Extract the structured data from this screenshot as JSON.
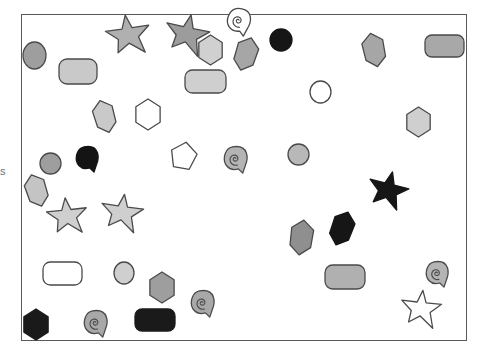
{
  "canvas": {
    "width": 481,
    "height": 355,
    "background": "#ffffff",
    "edge_mark_text": "s"
  },
  "frame": {
    "x": 21,
    "y": 14,
    "width": 446,
    "height": 327,
    "stroke": "#58585a",
    "stroke_width": 1.4,
    "fill": "#ffffff"
  },
  "palette": {
    "outline": "#4a4a4a",
    "black": "#1a1a1a",
    "dark_gray": "#8c8c8c",
    "mid_gray": "#9e9e9e",
    "light_gray": "#c9c9c9",
    "pale_gray": "#d6d6d6",
    "white": "#ffffff"
  },
  "shapes": [
    {
      "name": "circle-top-left-gray",
      "type": "circle",
      "x": 23,
      "y": 42,
      "w": 23,
      "h": 27,
      "fill": "#9e9e9e",
      "stroke": "#4a4a4a",
      "rotate": 0
    },
    {
      "name": "star-top-light-gray",
      "type": "star",
      "x": 105,
      "y": 13,
      "w": 46,
      "h": 44,
      "fill": "#b0b0b0",
      "stroke": "#4a4a4a",
      "rotate": -8
    },
    {
      "name": "star-top-mid-gray",
      "type": "star",
      "x": 164,
      "y": 12,
      "w": 46,
      "h": 44,
      "fill": "#9c9c9c",
      "stroke": "#4a4a4a",
      "rotate": 12
    },
    {
      "name": "hexagon-top-pale",
      "type": "hexagon",
      "x": 197,
      "y": 35,
      "w": 27,
      "h": 30,
      "fill": "#d0d0d0",
      "stroke": "#4a4a4a",
      "rotate": 0
    },
    {
      "name": "spiral-top-white",
      "type": "spiral",
      "x": 226,
      "y": 8,
      "w": 26,
      "h": 27,
      "fill": "#ffffff",
      "stroke": "#4a4a4a",
      "rotate": 10
    },
    {
      "name": "diamond-top-gray",
      "type": "diamond",
      "x": 234,
      "y": 37,
      "w": 24,
      "h": 34,
      "fill": "#a6a6a6",
      "stroke": "#4a4a4a",
      "rotate": 18
    },
    {
      "name": "circle-top-black",
      "type": "circle",
      "x": 270,
      "y": 29,
      "w": 22,
      "h": 22,
      "fill": "#161616",
      "stroke": "#161616",
      "rotate": 0
    },
    {
      "name": "diamond-top-right-gray",
      "type": "diamond",
      "x": 362,
      "y": 33,
      "w": 24,
      "h": 34,
      "fill": "#a6a6a6",
      "stroke": "#4a4a4a",
      "rotate": -12
    },
    {
      "name": "rounded-rect-top-right-gray",
      "type": "rrect",
      "x": 425,
      "y": 35,
      "w": 39,
      "h": 22,
      "fill": "#a8a8a8",
      "stroke": "#4a4a4a",
      "rotate": 0
    },
    {
      "name": "rounded-rect-left-pale",
      "type": "rrect",
      "x": 59,
      "y": 59,
      "w": 38,
      "h": 25,
      "fill": "#c9c9c9",
      "stroke": "#4a4a4a",
      "rotate": 0
    },
    {
      "name": "rounded-rect-center-pale",
      "type": "rrect",
      "x": 185,
      "y": 70,
      "w": 41,
      "h": 23,
      "fill": "#cfcfcf",
      "stroke": "#4a4a4a",
      "rotate": 0
    },
    {
      "name": "circle-center-white",
      "type": "circle",
      "x": 310,
      "y": 81,
      "w": 21,
      "h": 22,
      "fill": "#ffffff",
      "stroke": "#4a4a4a",
      "rotate": 0
    },
    {
      "name": "diamond-left-pale",
      "type": "diamond",
      "x": 93,
      "y": 100,
      "w": 23,
      "h": 33,
      "fill": "#c9c9c9",
      "stroke": "#4a4a4a",
      "rotate": -16
    },
    {
      "name": "hexagon-left-white",
      "type": "hexagon",
      "x": 134,
      "y": 99,
      "w": 28,
      "h": 31,
      "fill": "#ffffff",
      "stroke": "#4a4a4a",
      "rotate": 0
    },
    {
      "name": "hexagon-right-pale",
      "type": "hexagon",
      "x": 405,
      "y": 107,
      "w": 27,
      "h": 30,
      "fill": "#cfcfcf",
      "stroke": "#4a4a4a",
      "rotate": 0
    },
    {
      "name": "circle-mid-left-gray",
      "type": "circle",
      "x": 40,
      "y": 153,
      "w": 21,
      "h": 21,
      "fill": "#9e9e9e",
      "stroke": "#4a4a4a",
      "rotate": 0
    },
    {
      "name": "spiral-mid-black",
      "type": "spiral",
      "x": 75,
      "y": 146,
      "w": 25,
      "h": 26,
      "fill": "#141414",
      "stroke": "#141414",
      "rotate": 0
    },
    {
      "name": "pentagon-mid-white",
      "type": "pentagon",
      "x": 170,
      "y": 142,
      "w": 27,
      "h": 29,
      "fill": "#ffffff",
      "stroke": "#4a4a4a",
      "rotate": 20
    },
    {
      "name": "spiral-mid-gray",
      "type": "spiral",
      "x": 223,
      "y": 146,
      "w": 26,
      "h": 27,
      "fill": "#b4b4b4",
      "stroke": "#4a4a4a",
      "rotate": 0
    },
    {
      "name": "circle-mid-right-gray",
      "type": "circle",
      "x": 288,
      "y": 144,
      "w": 21,
      "h": 21,
      "fill": "#b8b8b8",
      "stroke": "#4a4a4a",
      "rotate": 0
    },
    {
      "name": "diamond-left-lower-pale",
      "type": "diamond",
      "x": 25,
      "y": 174,
      "w": 23,
      "h": 33,
      "fill": "#c4c4c4",
      "stroke": "#4a4a4a",
      "rotate": -18
    },
    {
      "name": "star-right-black",
      "type": "star",
      "x": 367,
      "y": 170,
      "w": 42,
      "h": 40,
      "fill": "#161616",
      "stroke": "#161616",
      "rotate": 14
    },
    {
      "name": "star-lower-left-pale",
      "type": "star",
      "x": 46,
      "y": 196,
      "w": 42,
      "h": 40,
      "fill": "#cfcfcf",
      "stroke": "#4a4a4a",
      "rotate": -6
    },
    {
      "name": "star-lower-mid-pale",
      "type": "star",
      "x": 100,
      "y": 192,
      "w": 44,
      "h": 41,
      "fill": "#cfcfcf",
      "stroke": "#4a4a4a",
      "rotate": 8
    },
    {
      "name": "diamond-lower-gray",
      "type": "diamond",
      "x": 289,
      "y": 220,
      "w": 25,
      "h": 35,
      "fill": "#8f8f8f",
      "stroke": "#4a4a4a",
      "rotate": 8
    },
    {
      "name": "diamond-lower-black",
      "type": "diamond",
      "x": 330,
      "y": 211,
      "w": 24,
      "h": 35,
      "fill": "#161616",
      "stroke": "#161616",
      "rotate": 20
    },
    {
      "name": "rounded-rect-lower-white",
      "type": "rrect",
      "x": 43,
      "y": 262,
      "w": 39,
      "h": 23,
      "fill": "#ffffff",
      "stroke": "#4a4a4a",
      "rotate": 0
    },
    {
      "name": "circle-lower-pale",
      "type": "circle",
      "x": 114,
      "y": 262,
      "w": 20,
      "h": 22,
      "fill": "#cfcfcf",
      "stroke": "#4a4a4a",
      "rotate": 0
    },
    {
      "name": "rounded-rect-lower-pale",
      "type": "rrect",
      "x": 325,
      "y": 265,
      "w": 40,
      "h": 24,
      "fill": "#b0b0b0",
      "stroke": "#4a4a4a",
      "rotate": 0
    },
    {
      "name": "spiral-lower-right-gray",
      "type": "spiral",
      "x": 425,
      "y": 261,
      "w": 25,
      "h": 26,
      "fill": "#b4b4b4",
      "stroke": "#4a4a4a",
      "rotate": 0
    },
    {
      "name": "hexagon-lower-gray",
      "type": "hexagon",
      "x": 148,
      "y": 272,
      "w": 28,
      "h": 31,
      "fill": "#9e9e9e",
      "stroke": "#4a4a4a",
      "rotate": 0
    },
    {
      "name": "spiral-lower-mid-gray",
      "type": "spiral",
      "x": 190,
      "y": 290,
      "w": 26,
      "h": 27,
      "fill": "#a8a8a8",
      "stroke": "#4a4a4a",
      "rotate": 0
    },
    {
      "name": "star-lower-right-white",
      "type": "star",
      "x": 400,
      "y": 288,
      "w": 42,
      "h": 41,
      "fill": "#ffffff",
      "stroke": "#4a4a4a",
      "rotate": 6
    },
    {
      "name": "rounded-rect-bottom-black",
      "type": "rrect",
      "x": 135,
      "y": 309,
      "w": 40,
      "h": 22,
      "fill": "#1a1a1a",
      "stroke": "#1a1a1a",
      "rotate": 0
    },
    {
      "name": "hexagon-bottom-black",
      "type": "hexagon",
      "x": 22,
      "y": 309,
      "w": 28,
      "h": 31,
      "fill": "#1a1a1a",
      "stroke": "#1a1a1a",
      "rotate": 0
    },
    {
      "name": "spiral-bottom-gray",
      "type": "spiral",
      "x": 83,
      "y": 310,
      "w": 26,
      "h": 27,
      "fill": "#a8a8a8",
      "stroke": "#4a4a4a",
      "rotate": 0
    }
  ]
}
